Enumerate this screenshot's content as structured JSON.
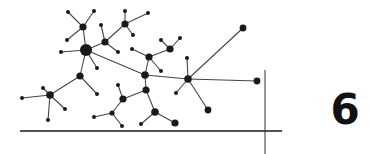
{
  "chapter": {
    "number": "6"
  },
  "colors": {
    "ink": "#1a1a1a",
    "background": "#ffffff",
    "edge": "#444444"
  },
  "diagram": {
    "type": "network-graph",
    "axes": {
      "horizontal": {
        "x1": 20,
        "y1": 131,
        "x2": 282,
        "y2": 131
      },
      "vertical": {
        "x1": 265,
        "y1": 70,
        "x2": 265,
        "y2": 154
      }
    },
    "nodes": [
      {
        "id": "hub-main",
        "x": 86,
        "y": 50,
        "r": 6
      },
      {
        "id": "n-top-left",
        "x": 83,
        "y": 27,
        "r": 3.6
      },
      {
        "id": "l1",
        "x": 68,
        "y": 12,
        "r": 2
      },
      {
        "id": "l2",
        "x": 94,
        "y": 11,
        "r": 2
      },
      {
        "id": "l3",
        "x": 67,
        "y": 40,
        "r": 2
      },
      {
        "id": "l4",
        "x": 61,
        "y": 52,
        "r": 2
      },
      {
        "id": "l5",
        "x": 97,
        "y": 68,
        "r": 2
      },
      {
        "id": "n-mid-left",
        "x": 80,
        "y": 76,
        "r": 3.6
      },
      {
        "id": "l6",
        "x": 97,
        "y": 94,
        "r": 2
      },
      {
        "id": "hub-left",
        "x": 50,
        "y": 95,
        "r": 3.8
      },
      {
        "id": "l7",
        "x": 43,
        "y": 88,
        "r": 2
      },
      {
        "id": "l8",
        "x": 22,
        "y": 98,
        "r": 2
      },
      {
        "id": "l9",
        "x": 48,
        "y": 120,
        "r": 2
      },
      {
        "id": "l10",
        "x": 65,
        "y": 109,
        "r": 2
      },
      {
        "id": "n-upper",
        "x": 105,
        "y": 42,
        "r": 3.6
      },
      {
        "id": "l11",
        "x": 101,
        "y": 25,
        "r": 2
      },
      {
        "id": "l12",
        "x": 118,
        "y": 52,
        "r": 2
      },
      {
        "id": "n-top",
        "x": 125,
        "y": 24,
        "r": 3.6
      },
      {
        "id": "l13",
        "x": 125,
        "y": 11,
        "r": 2
      },
      {
        "id": "l14",
        "x": 148,
        "y": 13,
        "r": 2
      },
      {
        "id": "l15",
        "x": 133,
        "y": 35,
        "r": 2
      },
      {
        "id": "n-center-top",
        "x": 149,
        "y": 57,
        "r": 3.6
      },
      {
        "id": "l16",
        "x": 132,
        "y": 49,
        "r": 2
      },
      {
        "id": "l17",
        "x": 161,
        "y": 71,
        "r": 2
      },
      {
        "id": "n-right-top",
        "x": 170,
        "y": 49,
        "r": 3.6
      },
      {
        "id": "l18",
        "x": 161,
        "y": 40,
        "r": 2
      },
      {
        "id": "l19",
        "x": 180,
        "y": 38,
        "r": 2
      },
      {
        "id": "n-center",
        "x": 145,
        "y": 75,
        "r": 3.8
      },
      {
        "id": "n-center-low",
        "x": 146,
        "y": 90,
        "r": 3.6
      },
      {
        "id": "n-low-left",
        "x": 123,
        "y": 99,
        "r": 3.6
      },
      {
        "id": "l20",
        "x": 118,
        "y": 85,
        "r": 2
      },
      {
        "id": "n-low-branch",
        "x": 112,
        "y": 113,
        "r": 2.6
      },
      {
        "id": "l21",
        "x": 94,
        "y": 117,
        "r": 2
      },
      {
        "id": "l22",
        "x": 122,
        "y": 126,
        "r": 2
      },
      {
        "id": "n-low-right",
        "x": 155,
        "y": 112,
        "r": 3.8
      },
      {
        "id": "l23",
        "x": 141,
        "y": 124,
        "r": 2
      },
      {
        "id": "l24",
        "x": 175,
        "y": 123,
        "r": 3.6
      },
      {
        "id": "hub-right",
        "x": 188,
        "y": 79,
        "r": 3.8
      },
      {
        "id": "l25",
        "x": 187,
        "y": 58,
        "r": 2
      },
      {
        "id": "l26",
        "x": 176,
        "y": 93,
        "r": 2
      },
      {
        "id": "l27",
        "x": 208,
        "y": 110,
        "r": 3.4
      },
      {
        "id": "l28",
        "x": 243,
        "y": 28,
        "r": 3.4
      },
      {
        "id": "l29",
        "x": 257,
        "y": 81,
        "r": 3.4
      }
    ],
    "edges": [
      [
        "hub-main",
        "n-top-left"
      ],
      [
        "n-top-left",
        "l1"
      ],
      [
        "n-top-left",
        "l2"
      ],
      [
        "n-top-left",
        "l3"
      ],
      [
        "hub-main",
        "l4"
      ],
      [
        "hub-main",
        "l5"
      ],
      [
        "hub-main",
        "n-mid-left"
      ],
      [
        "hub-main",
        "n-upper"
      ],
      [
        "hub-main",
        "n-center"
      ],
      [
        "n-mid-left",
        "l6"
      ],
      [
        "n-mid-left",
        "hub-left"
      ],
      [
        "hub-left",
        "l7"
      ],
      [
        "hub-left",
        "l8"
      ],
      [
        "hub-left",
        "l9"
      ],
      [
        "hub-left",
        "l10"
      ],
      [
        "n-upper",
        "l11"
      ],
      [
        "n-upper",
        "l12"
      ],
      [
        "n-upper",
        "n-top"
      ],
      [
        "n-top",
        "l13"
      ],
      [
        "n-top",
        "l14"
      ],
      [
        "n-top",
        "l15"
      ],
      [
        "n-center",
        "n-center-top"
      ],
      [
        "n-center-top",
        "l16"
      ],
      [
        "n-center-top",
        "l17"
      ],
      [
        "n-center-top",
        "n-right-top"
      ],
      [
        "n-right-top",
        "l18"
      ],
      [
        "n-right-top",
        "l19"
      ],
      [
        "n-center",
        "n-center-low"
      ],
      [
        "n-center",
        "hub-right"
      ],
      [
        "n-center-low",
        "n-low-left"
      ],
      [
        "n-low-left",
        "l20"
      ],
      [
        "n-low-left",
        "n-low-branch"
      ],
      [
        "n-low-branch",
        "l21"
      ],
      [
        "n-low-branch",
        "l22"
      ],
      [
        "n-center-low",
        "n-low-right"
      ],
      [
        "n-low-right",
        "l23"
      ],
      [
        "n-low-right",
        "l24"
      ],
      [
        "hub-right",
        "l25"
      ],
      [
        "hub-right",
        "l26"
      ],
      [
        "hub-right",
        "l27"
      ],
      [
        "hub-right",
        "l28"
      ],
      [
        "hub-right",
        "l29"
      ]
    ]
  }
}
